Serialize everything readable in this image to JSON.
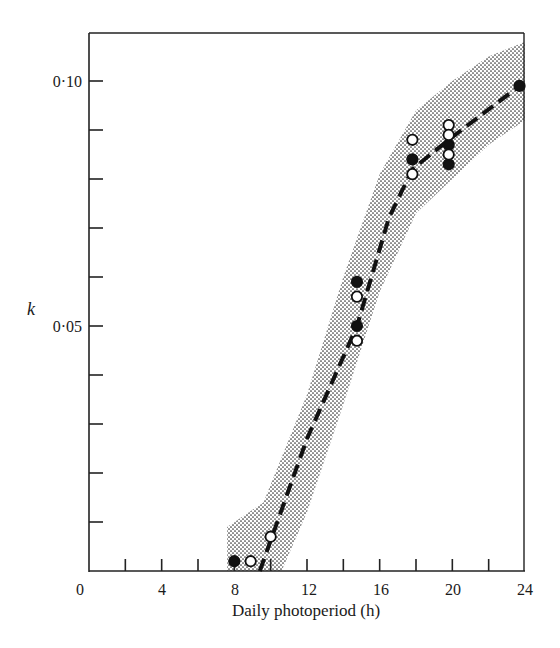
{
  "chart_data": {
    "type": "scatter",
    "title": "",
    "xlabel": "Daily photoperiod (h)",
    "ylabel": "k",
    "xlim": [
      0,
      24
    ],
    "ylim": [
      0,
      0.11
    ],
    "x_ticks": [
      0,
      4,
      8,
      12,
      16,
      20,
      24
    ],
    "x_tick_labels": [
      "0",
      "4",
      "8",
      "12",
      "16",
      "20",
      "24"
    ],
    "x_minor_ticks": [
      2,
      6,
      10,
      14,
      18,
      22
    ],
    "y_ticks": [
      0.05,
      0.1
    ],
    "y_tick_labels": [
      "0·05",
      "0·10"
    ],
    "y_minor_ticks": [
      0.01,
      0.02,
      0.03,
      0.04,
      0.06,
      0.07,
      0.08,
      0.09
    ],
    "grid": false,
    "legend": null,
    "series": [
      {
        "name": "filled circles",
        "marker": "filled-circle",
        "points": [
          {
            "x": 8.0,
            "y": 0.002
          },
          {
            "x": 14.75,
            "y": 0.059
          },
          {
            "x": 14.75,
            "y": 0.05
          },
          {
            "x": 17.8,
            "y": 0.084
          },
          {
            "x": 19.8,
            "y": 0.087
          },
          {
            "x": 19.8,
            "y": 0.083
          },
          {
            "x": 23.7,
            "y": 0.099
          }
        ]
      },
      {
        "name": "open circles",
        "marker": "open-circle",
        "points": [
          {
            "x": 8.9,
            "y": 0.002
          },
          {
            "x": 10.0,
            "y": 0.007
          },
          {
            "x": 14.75,
            "y": 0.056
          },
          {
            "x": 14.75,
            "y": 0.047
          },
          {
            "x": 17.8,
            "y": 0.088
          },
          {
            "x": 17.8,
            "y": 0.081
          },
          {
            "x": 19.8,
            "y": 0.091
          },
          {
            "x": 19.8,
            "y": 0.089
          },
          {
            "x": 19.8,
            "y": 0.085
          }
        ]
      },
      {
        "name": "fitted trend",
        "style": "dashed-line",
        "points": [
          {
            "x": 9.4,
            "y": 0.0
          },
          {
            "x": 12.0,
            "y": 0.027
          },
          {
            "x": 14.75,
            "y": 0.05
          },
          {
            "x": 16.5,
            "y": 0.072
          },
          {
            "x": 17.8,
            "y": 0.082
          },
          {
            "x": 19.8,
            "y": 0.088
          },
          {
            "x": 23.7,
            "y": 0.099
          }
        ]
      },
      {
        "name": "confidence band",
        "style": "stippled-area",
        "upper": [
          {
            "x": 7.6,
            "y": 0.009
          },
          {
            "x": 9.6,
            "y": 0.014
          },
          {
            "x": 12.0,
            "y": 0.036
          },
          {
            "x": 14.0,
            "y": 0.06
          },
          {
            "x": 16.0,
            "y": 0.081
          },
          {
            "x": 18.0,
            "y": 0.094
          },
          {
            "x": 20.0,
            "y": 0.1
          },
          {
            "x": 22.0,
            "y": 0.105
          },
          {
            "x": 24.0,
            "y": 0.108
          }
        ],
        "lower": [
          {
            "x": 7.6,
            "y": 0.0
          },
          {
            "x": 10.6,
            "y": 0.0
          },
          {
            "x": 12.0,
            "y": 0.012
          },
          {
            "x": 14.0,
            "y": 0.034
          },
          {
            "x": 16.0,
            "y": 0.057
          },
          {
            "x": 18.0,
            "y": 0.073
          },
          {
            "x": 20.0,
            "y": 0.08
          },
          {
            "x": 22.0,
            "y": 0.087
          },
          {
            "x": 24.0,
            "y": 0.092
          }
        ]
      }
    ]
  },
  "labels": {
    "xlabel": "Daily photoperiod (h)",
    "ylabel": "k",
    "x_ticks": [
      "0",
      "4",
      "8",
      "12",
      "16",
      "20",
      "24"
    ],
    "y_ticks": [
      "0·05",
      "0·10"
    ]
  }
}
